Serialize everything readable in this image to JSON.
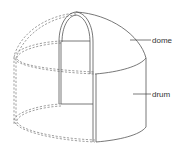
{
  "diagram": {
    "labels": [
      {
        "id": "dome",
        "text": "dome"
      },
      {
        "id": "drum",
        "text": "drum"
      }
    ],
    "colors": {
      "line": "#555555",
      "hidden_line": "#777777",
      "text": "#333333",
      "background": "#ffffff"
    }
  }
}
